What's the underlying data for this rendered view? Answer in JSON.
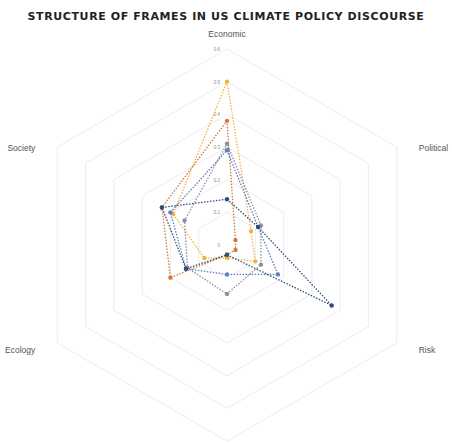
{
  "chart_data": {
    "type": "radar",
    "title": "STRUCTURE OF FRAMES IN US CLIMATE POLICY DISCOURSE",
    "categories": [
      "Economic",
      "Political",
      "Risk",
      "",
      "Ecology",
      "Society"
    ],
    "rlim": [
      0,
      0.6
    ],
    "ticks": [
      "0",
      "0.1",
      "0.2",
      "0.3",
      "0.4",
      "0.5",
      "0.6"
    ],
    "grid": true,
    "legend": "none",
    "series": [
      {
        "name": "Series 1",
        "color": "#f2b33d",
        "values": [
          0.5,
          0.085,
          0.1,
          0.04,
          0.08,
          0.19
        ]
      },
      {
        "name": "Series 2",
        "color": "#d0793a",
        "values": [
          0.38,
          0.03,
          0.03,
          0.03,
          0.2,
          0.23
        ]
      },
      {
        "name": "Series 3",
        "color": "#8e8ea0",
        "values": [
          0.31,
          0.12,
          0.12,
          0.15,
          0.14,
          0.15
        ]
      },
      {
        "name": "Series 4",
        "color": "#5b7fbf",
        "values": [
          0.29,
          0.11,
          0.18,
          0.09,
          0.145,
          0.2
        ]
      },
      {
        "name": "Series 5",
        "color": "#2f4b7c",
        "values": [
          0.14,
          0.11,
          0.37,
          0.03,
          0.145,
          0.23
        ]
      }
    ]
  },
  "layout": {
    "cx": 227,
    "cy": 245,
    "radius": 196
  }
}
